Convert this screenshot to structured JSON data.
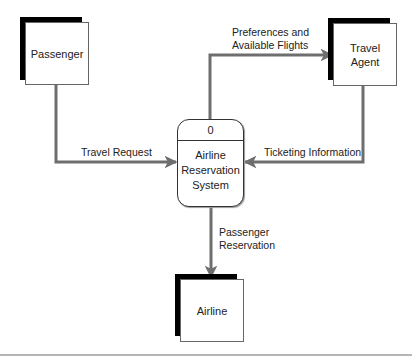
{
  "diagram": {
    "type": "data-flow-diagram",
    "process": {
      "id": "0",
      "name_lines": [
        "Airline",
        "Reservation",
        "System"
      ]
    },
    "entities": {
      "passenger": {
        "label": "Passenger"
      },
      "travel_agent": {
        "label_lines": [
          "Travel",
          "Agent"
        ]
      },
      "airline": {
        "label": "Airline"
      }
    },
    "flows": {
      "travel_request": {
        "label": "Travel Request",
        "from": "Passenger",
        "to": "Airline Reservation System"
      },
      "preferences": {
        "label_lines": [
          "Preferences and",
          "Available Flights"
        ],
        "from": "Airline Reservation System",
        "to": "Travel Agent"
      },
      "ticketing": {
        "label": "Ticketing Information",
        "from": "Travel Agent",
        "to": "Airline Reservation System"
      },
      "passenger_reservation": {
        "label_lines": [
          "Passenger",
          "Reservation"
        ],
        "from": "Airline Reservation System",
        "to": "Airline"
      }
    },
    "colors": {
      "flow_line": "#6e6e6e",
      "shadow": "#000000",
      "rule": "#b5b5b5"
    }
  }
}
